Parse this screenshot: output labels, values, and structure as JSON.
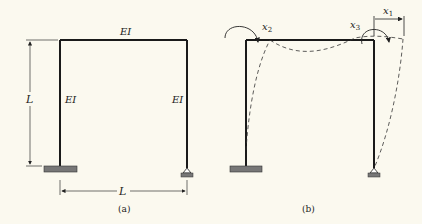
{
  "panel_a": {
    "caption": "(a)",
    "beam_label": "EI",
    "left_column_label": "EI",
    "right_column_label": "EI",
    "height_dim_label": "L",
    "span_dim_label": "L"
  },
  "panel_b": {
    "caption": "(b)",
    "dof_labels": {
      "x1": {
        "base": "x",
        "sub": "1"
      },
      "x2": {
        "base": "x",
        "sub": "2"
      },
      "x3": {
        "base": "x",
        "sub": "3"
      }
    }
  },
  "colors": {
    "background": "#fbf9ef",
    "member": "#1a1a1a",
    "support_fill": "#777777"
  }
}
